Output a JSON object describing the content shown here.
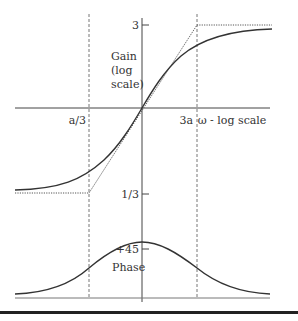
{
  "diagram": {
    "type": "bode-plot-lead-network",
    "colors": {
      "curve": "#333333",
      "axis": "#444444",
      "guide": "#777777",
      "rule": "#222222"
    },
    "gain_panel": {
      "axis_label_lines": [
        "Gain",
        "(log",
        "scale)"
      ],
      "y_ticks": [
        {
          "label": "3",
          "y": 25
        },
        {
          "label": "1/3",
          "y": 194
        }
      ],
      "x_ticks": [
        {
          "label": "a/3",
          "x": 89
        },
        {
          "label": "3a",
          "x": 197
        }
      ],
      "x_axis_label": "ω - log scale",
      "asymptotes": {
        "low": {
          "value": "1/3",
          "from_x": 15,
          "to_x": 89
        },
        "high": {
          "value": "3",
          "from_x": 197,
          "to_x": 272
        }
      }
    },
    "phase_panel": {
      "label": "Phase",
      "y_ticks": [
        {
          "label": "+45",
          "y": 249
        }
      ],
      "peak_at": "center frequency (a)"
    }
  }
}
